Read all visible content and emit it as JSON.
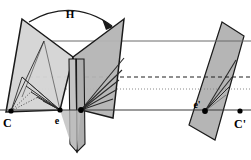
{
  "figure": {
    "background_color": "#ffffff",
    "width": 251,
    "height": 160,
    "labels": [
      {
        "id": "H",
        "text": "H",
        "x": 70,
        "y": 17,
        "size": 11,
        "style": "bold-italic-serif"
      },
      {
        "id": "C",
        "text": "C",
        "x": 3,
        "y": 127,
        "size": 12,
        "style": "bold-serif"
      },
      {
        "id": "e",
        "text": "e",
        "x": 57,
        "y": 124,
        "size": 10,
        "style": "bold-serif"
      },
      {
        "id": "e-prime",
        "text": "e'",
        "x": 197,
        "y": 108,
        "size": 10,
        "style": "bold-serif"
      },
      {
        "id": "C-prime",
        "text": "C'",
        "x": 236,
        "y": 128,
        "size": 12,
        "style": "bold-serif"
      }
    ],
    "points": [
      {
        "id": "C",
        "x": 11,
        "y": 111,
        "r": 2.6
      },
      {
        "id": "e",
        "x": 60,
        "y": 110,
        "r": 2.6
      },
      {
        "id": "x-image",
        "x": 81,
        "y": 110,
        "r": 2.8
      },
      {
        "id": "e-prime",
        "x": 205,
        "y": 111,
        "r": 2.8
      },
      {
        "id": "C-prime",
        "x": 240,
        "y": 111,
        "r": 2.6
      }
    ],
    "colors": {
      "plane_fill_light": "#d2d2d2",
      "plane_fill_mid": "#b8b8b8",
      "plane_fill_dark": "#a8a8a8",
      "plane_fill_strip": "#c8c8c8",
      "outline": "#1a1a1a",
      "thin_line": "#555555",
      "baseline": "#3a3a3a",
      "dashed_line": "#222222",
      "dotted_line": "#777777"
    },
    "arc": {
      "id": "homography-arc",
      "path": "M 29 22 Q 72 -2 112 25",
      "arrowhead": "M 112 25 L 104 20 L 109 29 Z"
    },
    "baseline": {
      "y": 110,
      "x1": 0,
      "x2": 251
    },
    "guide_lines": [
      {
        "id": "solid-top",
        "type": "solid",
        "y": 41,
        "x1": 44,
        "x2": 251
      },
      {
        "id": "dashed-mid",
        "type": "dashed",
        "y": 77,
        "x1": 22,
        "x2": 251
      },
      {
        "id": "dotted-mid",
        "type": "dotted",
        "y": 89,
        "x1": 27,
        "x2": 251
      },
      {
        "id": "solid-bottom",
        "type": "solid",
        "y": 110,
        "x1": 0,
        "x2": 251
      }
    ],
    "planes": [
      {
        "id": "left-plane",
        "points": "22,19 73,57 60,110 6,112",
        "fill": "#d2d2d2"
      },
      {
        "id": "right-wing-plane",
        "points": "124,19 73,57 81,110 113,118",
        "fill": "#b4b4b4"
      },
      {
        "id": "center-strip-a",
        "points": "70,60 77,60 78,152 71,145",
        "fill": "#c0c0c0"
      },
      {
        "id": "center-strip-b",
        "points": "77,60 84,60 85,145 78,152",
        "fill": "#b0b0b0"
      },
      {
        "id": "far-plane",
        "points": "222,22 244,36 215,140 189,125",
        "fill": "#b5b5b5"
      }
    ],
    "rays": {
      "from_e_label": "rays from epipole e",
      "from_e_prime_label": "rays from epipole e'",
      "count_left": 5,
      "count_right": 4
    }
  }
}
